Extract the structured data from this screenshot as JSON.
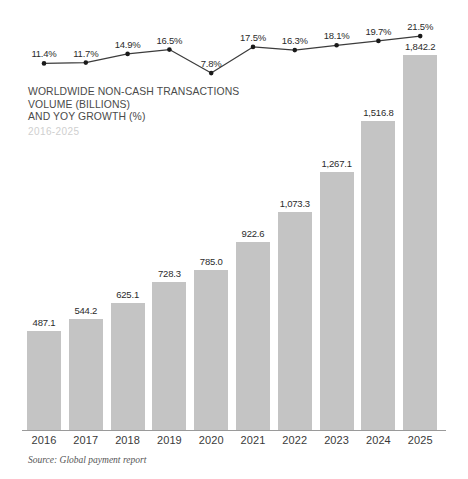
{
  "title": {
    "line1": "WORLDWIDE NON-CASH TRANSACTIONS",
    "line2": "VOLUME (BILLIONS)",
    "line3": "AND YOY GROWTH (%)",
    "subtitle": "2016-2025"
  },
  "source": {
    "text": "Source: Global payment report"
  },
  "colors": {
    "bar": "#c4c4c4",
    "line": "#3c3c3c",
    "marker": "#1a1a1a",
    "axis": "#9a9a9a",
    "title_text": "#4a4a4a",
    "subtitle_text": "#cfcfcf",
    "label_text": "#2b2b2b"
  },
  "chart_data": {
    "type": "bar",
    "title": "WORLDWIDE NON-CASH TRANSACTIONS VOLUME (BILLIONS) AND YOY GROWTH (%)",
    "subtitle": "2016-2025",
    "xlabel": "",
    "ylabel": "",
    "grid": false,
    "legend_position": "none",
    "categories": [
      "2016",
      "2017",
      "2018",
      "2019",
      "2020",
      "2021",
      "2022",
      "2023",
      "2024",
      "2025"
    ],
    "ylim": [
      0,
      1842.2
    ],
    "series": [
      {
        "name": "Worldwide non-cash transactions volume (billions)",
        "type": "bar",
        "values": [
          487.1,
          544.2,
          625.1,
          728.3,
          785.0,
          922.6,
          1073.3,
          1267.1,
          1516.8,
          1842.2
        ],
        "labels": [
          "487.1",
          "544.2",
          "625.1",
          "728.3",
          "785.0",
          "922.6",
          "1,073.3",
          "1,267.1",
          "1,516.8",
          "1,842.2"
        ]
      },
      {
        "name": "YoY growth (%)",
        "type": "line",
        "values": [
          11.4,
          11.7,
          14.9,
          16.5,
          7.8,
          17.5,
          16.3,
          18.1,
          19.7,
          21.5
        ],
        "labels": [
          "11.4%",
          "11.7%",
          "14.9%",
          "16.5%",
          "7.8%",
          "17.5%",
          "16.3%",
          "18.1%",
          "19.7%",
          "21.5%"
        ]
      }
    ]
  }
}
